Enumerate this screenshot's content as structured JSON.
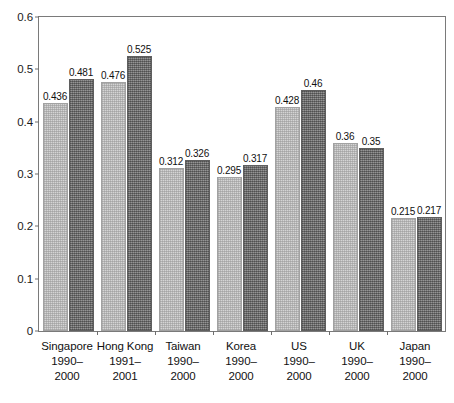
{
  "chart_data": {
    "type": "bar",
    "title": "",
    "subtitle": "",
    "xlabel": "",
    "ylabel": "",
    "ylim": [
      0,
      0.6
    ],
    "yticks": [
      "0",
      "0.1",
      "0.2",
      "0.3",
      "0.4",
      "0.5",
      "0.6"
    ],
    "ytick_values": [
      0,
      0.1,
      0.2,
      0.3,
      0.4,
      0.5,
      0.6
    ],
    "grid": false,
    "legend": "none",
    "categories": [
      "Singapore",
      "Hong Kong",
      "Taiwan",
      "Korea",
      "US",
      "UK",
      "Japan"
    ],
    "category_periods": [
      "1990–2000",
      "1991–2001",
      "1990–2000",
      "1990–2000",
      "1990–2000",
      "1990–2000",
      "1990–2000"
    ],
    "series": [
      {
        "name": "series-light",
        "color": "#d4d4d4",
        "values": [
          0.436,
          0.476,
          0.312,
          0.295,
          0.428,
          0.36,
          0.215
        ],
        "labels": [
          "0.436",
          "0.476",
          "0.312",
          "0.295",
          "0.428",
          "0.36",
          "0.215"
        ]
      },
      {
        "name": "series-dark",
        "color": "#7f7f7f",
        "values": [
          0.481,
          0.525,
          0.326,
          0.317,
          0.46,
          0.35,
          0.217
        ],
        "labels": [
          "0.481",
          "0.525",
          "0.326",
          "0.317",
          "0.46",
          "0.35",
          "0.217"
        ]
      }
    ]
  },
  "axis": {
    "frame_color": "#7a7a7a",
    "tick_color": "#6e6e6e",
    "text_color": "#111111"
  }
}
